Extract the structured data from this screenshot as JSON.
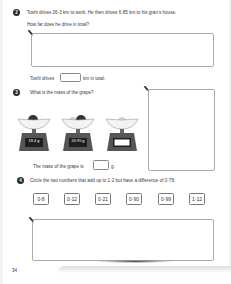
{
  "questions": [
    {
      "number": "2",
      "text": "Toshi drives 26·3 km to work. He then drives 6·85 km to his gran’s house.",
      "subtext": "How far does he drive in total?",
      "answer_prefix": "Toshi drives",
      "answer_suffix": "km in total.",
      "answer_value": ""
    },
    {
      "number": "3",
      "text": "What is the mass of the grape?",
      "scales": [
        {
          "display": "18·4 g",
          "contents": "plum"
        },
        {
          "display": "20·95 g",
          "contents": "plum and grape"
        },
        {
          "display": "",
          "contents": "grape"
        }
      ],
      "answer_prefix": "The mass of the grape is",
      "answer_suffix": "g.",
      "answer_value": ""
    },
    {
      "number": "4",
      "text": "Circle the two numbers that add up to 1·2 but have a difference of 0·78.",
      "options": [
        "0·8",
        "0·12",
        "0·21",
        "0·90",
        "0·99",
        "1·12"
      ]
    }
  ],
  "icons": {
    "pencil": "pencil-icon"
  },
  "page_number": "34"
}
